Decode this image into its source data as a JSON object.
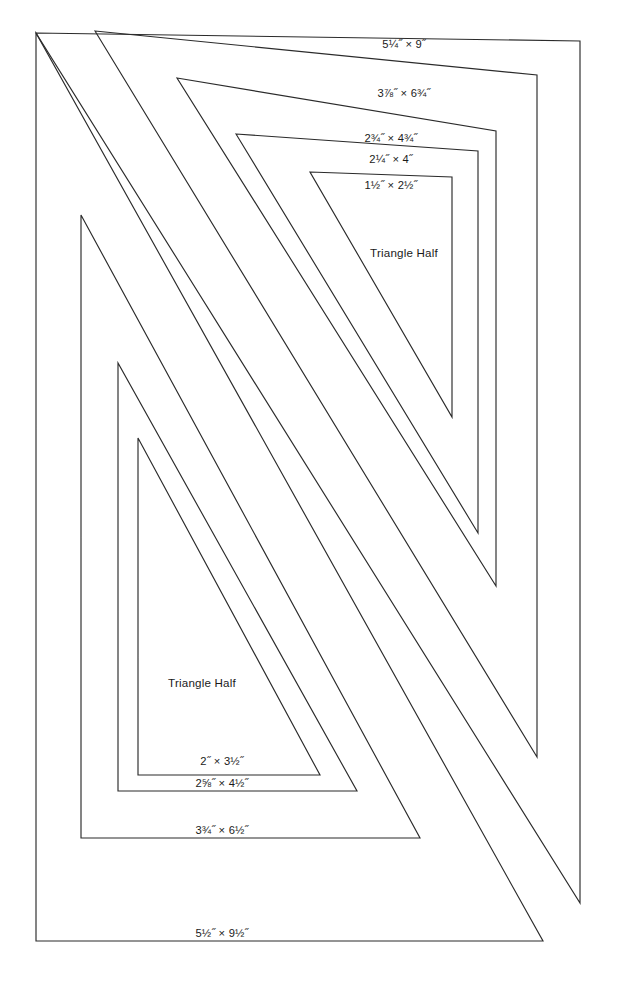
{
  "page": {
    "background_color": "#ffffff",
    "line_color": "#2b2b2b",
    "text_color": "#1a1a1a",
    "width": 627,
    "height": 991
  },
  "group_upper": {
    "name": "upper-right-triangle-group",
    "shape_label": "Triangle Half",
    "shape_label_pos": {
      "x": 404,
      "y": 257
    },
    "templates": [
      {
        "id": "upper-1",
        "size_label": "5¼˝ × 9˝",
        "points": "36,33 580,41 580,903",
        "label_pos": {
          "x": 404,
          "y": 48
        }
      },
      {
        "id": "upper-2",
        "size_label": "3⅞˝ × 6¾˝",
        "points": "95,31 537,75 537,757",
        "label_pos": {
          "x": 404,
          "y": 97
        }
      },
      {
        "id": "upper-3",
        "size_label": "2¾˝ × 4¾˝",
        "points": "177,78 496,131 496,586",
        "label_pos": {
          "x": 391,
          "y": 142
        }
      },
      {
        "id": "upper-4",
        "size_label": "2¼˝ × 4˝",
        "points": "236,134 478,151 478,533",
        "label_pos": {
          "x": 391,
          "y": 163
        }
      },
      {
        "id": "upper-5",
        "size_label": "1½˝ × 2½˝",
        "points": "310,172 452,177 452,417",
        "label_pos": {
          "x": 391,
          "y": 189
        }
      }
    ]
  },
  "group_lower": {
    "name": "lower-left-triangle-group",
    "shape_label": "Triangle Half",
    "shape_label_pos": {
      "x": 202,
      "y": 687
    },
    "templates": [
      {
        "id": "lower-1",
        "size_label": "5½˝ × 9½˝",
        "points": "36,33 36,941 543,941",
        "label_pos": {
          "x": 222,
          "y": 941
        }
      },
      {
        "id": "lower-2",
        "size_label": "3¾˝ × 6½˝",
        "points": "81,215 81,838 420,838",
        "label_pos": {
          "x": 222,
          "y": 834
        }
      },
      {
        "id": "lower-3",
        "size_label": "2⅝˝ × 4½˝",
        "points": "118,363 118,791 357,791",
        "label_pos": {
          "x": 222,
          "y": 787
        }
      },
      {
        "id": "lower-4",
        "size_label": "2˝ × 3½˝",
        "points": "138,438 138,775 320,775",
        "label_pos": {
          "x": 222,
          "y": 765
        }
      }
    ]
  }
}
